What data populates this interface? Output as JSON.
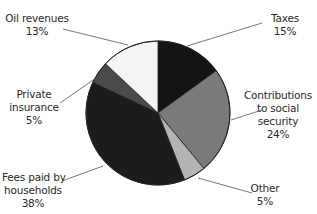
{
  "chart_data": {
    "type": "pie",
    "title": "",
    "start_angle_deg": 0,
    "direction": "clockwise",
    "slices": [
      {
        "label": "Taxes",
        "value": 15,
        "display": "15%",
        "color": "#141414"
      },
      {
        "label": "Contributions to social security",
        "value": 24,
        "display": "24%",
        "color": "#7a7a7a"
      },
      {
        "label": "Other",
        "value": 5,
        "display": "5%",
        "color": "#b4b4b4"
      },
      {
        "label": "Fees paid by households",
        "value": 38,
        "display": "38%",
        "color": "#1c1c1c"
      },
      {
        "label": "Private insurance",
        "value": 5,
        "display": "5%",
        "color": "#4a4a4a"
      },
      {
        "label": "Oil revenues",
        "value": 13,
        "display": "13%",
        "color": "#f4f4f4"
      }
    ],
    "legend": "none",
    "labels_position": "outside with leader lines"
  },
  "labels": {
    "taxes": {
      "line1": "Taxes",
      "pct": "15%"
    },
    "contrib": {
      "line1": "Contributions",
      "line2": "to social",
      "line3": "security",
      "pct": "24%"
    },
    "other": {
      "line1": "Other",
      "pct": "5%"
    },
    "fees": {
      "line1": "Fees paid by",
      "line2": "households",
      "pct": "38%"
    },
    "private": {
      "line1": "Private",
      "line2": "insurance",
      "pct": "5%"
    },
    "oil": {
      "line1": "Oil revenues",
      "pct": "13%"
    }
  }
}
